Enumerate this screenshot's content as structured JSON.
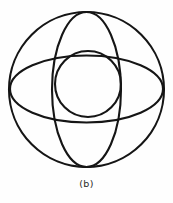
{
  "figure": {
    "caption": "(b)",
    "background_color": "#fefefe",
    "stroke_color": "#151515",
    "stroke_width": 2.1,
    "width": 173,
    "height": 203
  },
  "chart_data": {
    "type": "diagram",
    "title": "",
    "subtitle": "",
    "xlabel": "",
    "ylabel": "",
    "caption": "(b)",
    "grid": false,
    "legend": null,
    "units": "pixels",
    "coordinate_origin": "top-left",
    "shapes": [
      {
        "name": "outer-circle",
        "type": "circle",
        "cx": 86.5,
        "cy": 89.5,
        "r": 77.5,
        "rx": 77.5,
        "ry": 77.5,
        "rotation": 0,
        "stroke": "#151515",
        "stroke_width": 2.1,
        "fill": "none"
      },
      {
        "name": "vertical-ellipse",
        "type": "ellipse",
        "cx": 86.5,
        "cy": 89.5,
        "rx": 34.5,
        "ry": 77.5,
        "rotation": 0,
        "stroke": "#151515",
        "stroke_width": 2.1,
        "fill": "none"
      },
      {
        "name": "horizontal-ellipse",
        "type": "ellipse",
        "cx": 86.5,
        "cy": 89.0,
        "rx": 76.5,
        "ry": 33.5,
        "rotation": 0,
        "stroke": "#151515",
        "stroke_width": 2.1,
        "fill": "none"
      },
      {
        "name": "inner-circle",
        "type": "circle",
        "cx": 88.0,
        "cy": 84.0,
        "r": 33.0,
        "rx": 33.0,
        "ry": 33.0,
        "rotation": 0,
        "stroke": "#151515",
        "stroke_width": 2.1,
        "fill": "none"
      }
    ],
    "xlim": [
      0,
      173
    ],
    "ylim": [
      0,
      203
    ]
  }
}
